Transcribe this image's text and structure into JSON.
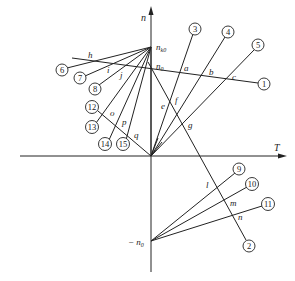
{
  "diagram": {
    "axes": {
      "vertical_label": "n",
      "horizontal_label": "T"
    },
    "points": {
      "n_k0": {
        "label": "n",
        "subscript": "k0"
      },
      "n_0": {
        "label": "n",
        "subscript": "0"
      },
      "neg_n_0": {
        "label": "− n",
        "subscript": "0"
      }
    },
    "curve_numbers": [
      "1",
      "2",
      "3",
      "4",
      "5",
      "6",
      "7",
      "8",
      "9",
      "10",
      "11",
      "12",
      "13",
      "14",
      "15"
    ],
    "intersection_labels": [
      "a",
      "b",
      "c",
      "e",
      "f",
      "g",
      "h",
      "i",
      "j",
      "l",
      "m",
      "n",
      "o",
      "p",
      "q"
    ]
  }
}
